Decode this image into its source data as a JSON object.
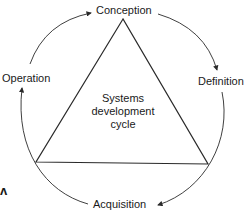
{
  "diagram": {
    "center_label": [
      "Systems",
      "development",
      "cycle"
    ],
    "phases": [
      {
        "name": "Conception",
        "position": "top"
      },
      {
        "name": "Definition",
        "position": "right"
      },
      {
        "name": "Acquisition",
        "position": "bottom"
      },
      {
        "name": "Operation",
        "position": "left"
      }
    ],
    "flow_direction": "clockwise",
    "stray_mark": "ʌ",
    "colors": {
      "line": "#2a2a2a",
      "text": "#1a1a1a",
      "background": "#ffffff"
    }
  }
}
